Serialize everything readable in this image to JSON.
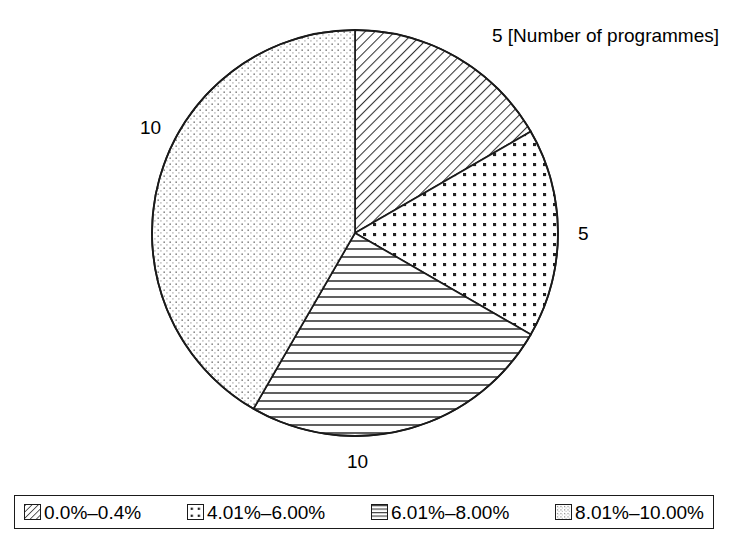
{
  "chart_data": {
    "type": "pie",
    "title": "",
    "unit_annotation": "[Number of programmes]",
    "total": 30,
    "categories": [
      "0.0%–0.4%",
      "4.01%–6.00%",
      "6.01%–8.00%",
      "8.01%–10.00%"
    ],
    "values": [
      5,
      5,
      10,
      10
    ],
    "slices": [
      {
        "label": "0.0%–0.4%",
        "value": 5,
        "value_text": "5",
        "annotation": "5 [Number of programmes]",
        "percent": 16.7,
        "start_angle_deg": 0,
        "end_angle_deg": 60,
        "pattern": "diagonal-hatch"
      },
      {
        "label": "4.01%–6.00%",
        "value": 5,
        "value_text": "5",
        "percent": 16.7,
        "start_angle_deg": 60,
        "end_angle_deg": 120,
        "pattern": "dot-grid"
      },
      {
        "label": "6.01%–8.00%",
        "value": 10,
        "value_text": "10",
        "percent": 33.3,
        "start_angle_deg": 120,
        "end_angle_deg": 210,
        "pattern": "horizontal-lines"
      },
      {
        "label": "8.01%–10.00%",
        "value": 10,
        "value_text": "10",
        "percent": 33.3,
        "start_angle_deg": 210,
        "end_angle_deg": 360,
        "pattern": "fine-stipple"
      }
    ],
    "legend": {
      "position": "bottom",
      "entries": [
        {
          "label": "0.0%–0.4%",
          "pattern": "diagonal-hatch"
        },
        {
          "label": "4.01%–6.00%",
          "pattern": "dot-grid"
        },
        {
          "label": "6.01%–8.00%",
          "pattern": "horizontal-lines"
        },
        {
          "label": "8.01%–10.00%",
          "pattern": "fine-stipple"
        }
      ]
    },
    "geometry": {
      "center_x": 355,
      "center_y": 233,
      "radius": 203
    },
    "colors": {
      "stroke": "#1a1a1a",
      "fill": "#ffffff"
    }
  }
}
